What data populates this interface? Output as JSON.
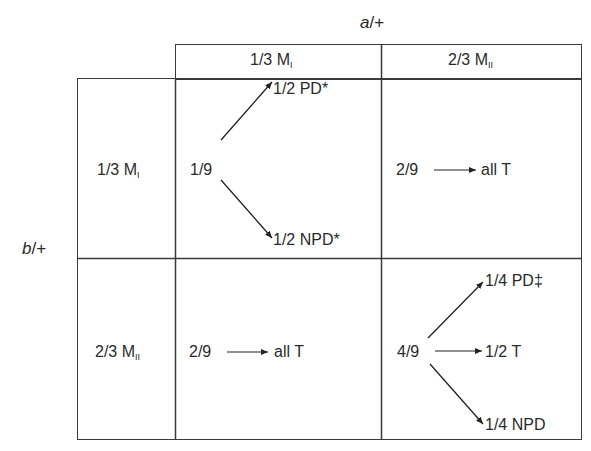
{
  "column_gene": {
    "gene": "a",
    "suffix": "/+"
  },
  "row_gene": {
    "gene": "b",
    "suffix": "/+"
  },
  "column_headers": [
    {
      "fraction": "1/3",
      "label": "M",
      "sub": "I"
    },
    {
      "fraction": "2/3",
      "label": "M",
      "sub": "II"
    }
  ],
  "row_headers": [
    {
      "fraction": "1/3",
      "label": "M",
      "sub": "I"
    },
    {
      "fraction": "2/3",
      "label": "M",
      "sub": "II"
    }
  ],
  "cells": {
    "r1c1": {
      "source": "1/9",
      "outcomes": [
        "1/2 PD*",
        "1/2 NPD*"
      ]
    },
    "r1c2": {
      "source": "2/9",
      "outcomes": [
        "all T"
      ]
    },
    "r2c1": {
      "source": "2/9",
      "outcomes": [
        "all T"
      ]
    },
    "r2c2": {
      "source": "4/9",
      "outcomes": [
        "1/4 PD‡",
        "1/2 T",
        "1/4 NPD"
      ]
    }
  },
  "colors": {
    "line": "#3a3a3a",
    "text": "#2a2a2a",
    "background": "#ffffff"
  }
}
